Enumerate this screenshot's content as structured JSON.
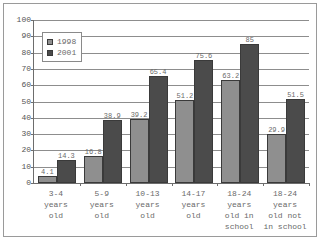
{
  "chart_data": {
    "type": "bar",
    "title": "",
    "subtitle": "",
    "xlabel": "",
    "ylabel": "",
    "ylim": [
      0,
      100
    ],
    "ytick_step": 10,
    "yticks": [
      0,
      10,
      20,
      30,
      40,
      50,
      60,
      70,
      80,
      90,
      100
    ],
    "grid": true,
    "legend_position": "top-left",
    "categories": [
      "3-4\nyears\nold",
      "5-9\nyears\nold",
      "10-13\nyears\nold",
      "14-17\nyears\nold",
      "18-24\nyears\nold in\nschool",
      "18-24\nyears\nold not\nin school"
    ],
    "category_lines": [
      [
        "3-4",
        "years",
        "old"
      ],
      [
        "5-9",
        "years",
        "old"
      ],
      [
        "10-13",
        "years",
        "old"
      ],
      [
        "14-17",
        "years",
        "old"
      ],
      [
        "18-24",
        "years",
        "old in",
        "school"
      ],
      [
        "18-24",
        "years",
        "old not",
        "in school"
      ]
    ],
    "series": [
      {
        "name": "1998",
        "color": "#8f8f8f",
        "values": [
          4.1,
          16.8,
          39.2,
          51.2,
          63.2,
          29.9
        ],
        "labels": [
          "4.1",
          "16.8",
          "39.2",
          "51.2",
          "63.2",
          "29.9"
        ]
      },
      {
        "name": "2001",
        "color": "#4b4b4b",
        "values": [
          14.3,
          38.9,
          65.4,
          75.6,
          85,
          51.5
        ],
        "labels": [
          "14.3",
          "38.9",
          "65.4",
          "75.6",
          "85",
          "51.5"
        ]
      }
    ]
  },
  "legend": {
    "entries": [
      {
        "label": "1998"
      },
      {
        "label": "2001"
      }
    ]
  },
  "colors": {
    "series_1998": "#8f8f8f",
    "series_2001": "#4b4b4b",
    "axis": "#6d6d6d",
    "gridline": "#8d8d8d",
    "frame": "#9a9a9a",
    "text": "#6a6a6a",
    "background": "#ffffff"
  }
}
